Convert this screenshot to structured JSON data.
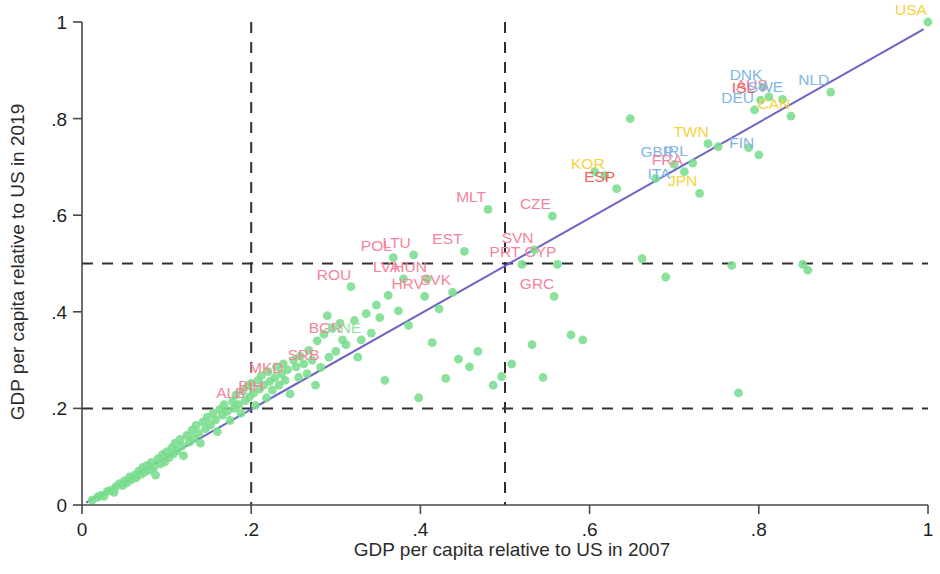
{
  "chart_data": {
    "type": "scatter",
    "title": "",
    "xlabel": "GDP per capita relative to US in 2007",
    "ylabel": "GDP per capita relative to US in 2019",
    "xlim": [
      0,
      1
    ],
    "ylim": [
      0,
      1
    ],
    "xticks": [
      "0",
      ".2",
      ".4",
      ".6",
      ".8",
      "1"
    ],
    "xtick_values": [
      0,
      0.2,
      0.4,
      0.6,
      0.8,
      1
    ],
    "yticks": [
      "0",
      ".2",
      ".4",
      ".6",
      ".8",
      "1"
    ],
    "ytick_values": [
      0,
      0.2,
      0.4,
      0.6,
      0.8,
      1
    ],
    "grid": false,
    "legend": "none",
    "colors": {
      "point": "#79dd8d",
      "fit_line": "#6b63c8",
      "reference_dash": "#303030",
      "label_pink": "#f4849b",
      "label_blue": "#7fb6e8",
      "label_yellow": "#f5d33c",
      "label_red": "#f0615f",
      "label_green": "#8fe3a0",
      "axis": "#4a4a4a"
    },
    "reference_lines": {
      "vertical": [
        0.2,
        0.5
      ],
      "horizontal": [
        0.2,
        0.5
      ],
      "style": "dashed"
    },
    "fit_line": {
      "type": "45-degree / regression",
      "x0": 0.005,
      "y0": 0.005,
      "x1": 0.995,
      "y1": 0.985
    },
    "labeled_points": [
      {
        "code": "USA",
        "x": 1.0,
        "y": 1.0,
        "color": "#f5d33c"
      },
      {
        "code": "NLD",
        "x": 0.885,
        "y": 0.855,
        "color": "#7fb6e8"
      },
      {
        "code": "DNK",
        "x": 0.805,
        "y": 0.865,
        "color": "#7fb6e8"
      },
      {
        "code": "AUS",
        "x": 0.812,
        "y": 0.845,
        "color": "#f4849b"
      },
      {
        "code": "ISL",
        "x": 0.802,
        "y": 0.838,
        "color": "#f0615f"
      },
      {
        "code": "SWE",
        "x": 0.828,
        "y": 0.84,
        "color": "#7fb6e8"
      },
      {
        "code": "DEU",
        "x": 0.795,
        "y": 0.818,
        "color": "#7fb6e8"
      },
      {
        "code": "CAN",
        "x": 0.838,
        "y": 0.805,
        "color": "#f5d33c"
      },
      {
        "code": "FIN",
        "x": 0.8,
        "y": 0.725,
        "color": "#7fb6e8"
      },
      {
        "code": "TWN",
        "x": 0.74,
        "y": 0.748,
        "color": "#f5d33c"
      },
      {
        "code": "GBR",
        "x": 0.7,
        "y": 0.705,
        "color": "#7fb6e8"
      },
      {
        "code": "IRL",
        "x": 0.722,
        "y": 0.708,
        "color": "#7fb6e8"
      },
      {
        "code": "FRA",
        "x": 0.712,
        "y": 0.69,
        "color": "#f4849b"
      },
      {
        "code": "ITA",
        "x": 0.702,
        "y": 0.66,
        "color": "#7fb6e8"
      },
      {
        "code": "JPN",
        "x": 0.73,
        "y": 0.645,
        "color": "#f5d33c"
      },
      {
        "code": "KOR",
        "x": 0.618,
        "y": 0.682,
        "color": "#f5d33c"
      },
      {
        "code": "ESP",
        "x": 0.632,
        "y": 0.655,
        "color": "#f0615f"
      },
      {
        "code": "CZE",
        "x": 0.556,
        "y": 0.598,
        "color": "#f4849b"
      },
      {
        "code": "MLT",
        "x": 0.48,
        "y": 0.612,
        "color": "#f4849b"
      },
      {
        "code": "EST",
        "x": 0.452,
        "y": 0.525,
        "color": "#f4849b"
      },
      {
        "code": "SVN",
        "x": 0.535,
        "y": 0.528,
        "color": "#f4849b"
      },
      {
        "code": "PRT",
        "x": 0.52,
        "y": 0.498,
        "color": "#f4849b"
      },
      {
        "code": "CYP",
        "x": 0.562,
        "y": 0.498,
        "color": "#f4849b"
      },
      {
        "code": "POL",
        "x": 0.368,
        "y": 0.512,
        "color": "#f4849b"
      },
      {
        "code": "LTU",
        "x": 0.392,
        "y": 0.518,
        "color": "#f4849b"
      },
      {
        "code": "LVA",
        "x": 0.38,
        "y": 0.468,
        "color": "#f4849b"
      },
      {
        "code": "HUN",
        "x": 0.408,
        "y": 0.468,
        "color": "#f4849b"
      },
      {
        "code": "SVK",
        "x": 0.438,
        "y": 0.44,
        "color": "#f4849b"
      },
      {
        "code": "HRV",
        "x": 0.405,
        "y": 0.432,
        "color": "#f4849b"
      },
      {
        "code": "ROU",
        "x": 0.318,
        "y": 0.452,
        "color": "#f4849b"
      },
      {
        "code": "GRC",
        "x": 0.558,
        "y": 0.432,
        "color": "#f4849b"
      },
      {
        "code": "BGR",
        "x": 0.308,
        "y": 0.342,
        "color": "#f4849b"
      },
      {
        "code": "MNE",
        "x": 0.33,
        "y": 0.342,
        "color": "#8fe3a0"
      },
      {
        "code": "SRB",
        "x": 0.282,
        "y": 0.285,
        "color": "#f4849b"
      },
      {
        "code": "MKD",
        "x": 0.238,
        "y": 0.258,
        "color": "#f4849b"
      },
      {
        "code": "BIH",
        "x": 0.22,
        "y": 0.222,
        "color": "#f4849b"
      },
      {
        "code": "ALB",
        "x": 0.196,
        "y": 0.208,
        "color": "#f4849b"
      }
    ],
    "points": [
      [
        0.012,
        0.01
      ],
      [
        0.018,
        0.016
      ],
      [
        0.022,
        0.02
      ],
      [
        0.026,
        0.018
      ],
      [
        0.03,
        0.028
      ],
      [
        0.034,
        0.03
      ],
      [
        0.038,
        0.026
      ],
      [
        0.04,
        0.038
      ],
      [
        0.044,
        0.044
      ],
      [
        0.048,
        0.04
      ],
      [
        0.05,
        0.05
      ],
      [
        0.053,
        0.046
      ],
      [
        0.056,
        0.058
      ],
      [
        0.058,
        0.052
      ],
      [
        0.062,
        0.062
      ],
      [
        0.064,
        0.056
      ],
      [
        0.067,
        0.07
      ],
      [
        0.07,
        0.064
      ],
      [
        0.072,
        0.078
      ],
      [
        0.074,
        0.068
      ],
      [
        0.077,
        0.082
      ],
      [
        0.08,
        0.072
      ],
      [
        0.082,
        0.088
      ],
      [
        0.085,
        0.078
      ],
      [
        0.087,
        0.062
      ],
      [
        0.09,
        0.096
      ],
      [
        0.093,
        0.085
      ],
      [
        0.095,
        0.104
      ],
      [
        0.098,
        0.09
      ],
      [
        0.1,
        0.11
      ],
      [
        0.103,
        0.098
      ],
      [
        0.106,
        0.118
      ],
      [
        0.108,
        0.106
      ],
      [
        0.11,
        0.128
      ],
      [
        0.112,
        0.112
      ],
      [
        0.116,
        0.136
      ],
      [
        0.118,
        0.122
      ],
      [
        0.12,
        0.102
      ],
      [
        0.124,
        0.144
      ],
      [
        0.127,
        0.13
      ],
      [
        0.13,
        0.155
      ],
      [
        0.132,
        0.138
      ],
      [
        0.135,
        0.165
      ],
      [
        0.138,
        0.148
      ],
      [
        0.14,
        0.128
      ],
      [
        0.143,
        0.172
      ],
      [
        0.146,
        0.158
      ],
      [
        0.148,
        0.182
      ],
      [
        0.152,
        0.166
      ],
      [
        0.155,
        0.19
      ],
      [
        0.158,
        0.176
      ],
      [
        0.16,
        0.152
      ],
      [
        0.163,
        0.198
      ],
      [
        0.166,
        0.186
      ],
      [
        0.168,
        0.208
      ],
      [
        0.172,
        0.194
      ],
      [
        0.175,
        0.175
      ],
      [
        0.178,
        0.214
      ],
      [
        0.18,
        0.2
      ],
      [
        0.182,
        0.228
      ],
      [
        0.185,
        0.208
      ],
      [
        0.188,
        0.19
      ],
      [
        0.19,
        0.236
      ],
      [
        0.193,
        0.216
      ],
      [
        0.196,
        0.246
      ],
      [
        0.198,
        0.224
      ],
      [
        0.2,
        0.252
      ],
      [
        0.203,
        0.232
      ],
      [
        0.205,
        0.206
      ],
      [
        0.208,
        0.258
      ],
      [
        0.21,
        0.24
      ],
      [
        0.212,
        0.268
      ],
      [
        0.215,
        0.248
      ],
      [
        0.218,
        0.222
      ],
      [
        0.22,
        0.276
      ],
      [
        0.222,
        0.256
      ],
      [
        0.225,
        0.238
      ],
      [
        0.228,
        0.264
      ],
      [
        0.23,
        0.286
      ],
      [
        0.233,
        0.248
      ],
      [
        0.236,
        0.272
      ],
      [
        0.238,
        0.292
      ],
      [
        0.24,
        0.258
      ],
      [
        0.243,
        0.28
      ],
      [
        0.246,
        0.23
      ],
      [
        0.25,
        0.3
      ],
      [
        0.253,
        0.286
      ],
      [
        0.256,
        0.264
      ],
      [
        0.258,
        0.308
      ],
      [
        0.262,
        0.292
      ],
      [
        0.266,
        0.272
      ],
      [
        0.268,
        0.32
      ],
      [
        0.272,
        0.3
      ],
      [
        0.276,
        0.248
      ],
      [
        0.278,
        0.34
      ],
      [
        0.282,
        0.285
      ],
      [
        0.286,
        0.354
      ],
      [
        0.29,
        0.392
      ],
      [
        0.292,
        0.306
      ],
      [
        0.296,
        0.366
      ],
      [
        0.3,
        0.318
      ],
      [
        0.305,
        0.376
      ],
      [
        0.308,
        0.342
      ],
      [
        0.312,
        0.332
      ],
      [
        0.318,
        0.452
      ],
      [
        0.322,
        0.382
      ],
      [
        0.326,
        0.306
      ],
      [
        0.33,
        0.342
      ],
      [
        0.336,
        0.396
      ],
      [
        0.342,
        0.356
      ],
      [
        0.348,
        0.414
      ],
      [
        0.352,
        0.388
      ],
      [
        0.358,
        0.258
      ],
      [
        0.362,
        0.434
      ],
      [
        0.368,
        0.512
      ],
      [
        0.374,
        0.402
      ],
      [
        0.38,
        0.468
      ],
      [
        0.386,
        0.372
      ],
      [
        0.392,
        0.518
      ],
      [
        0.398,
        0.222
      ],
      [
        0.405,
        0.432
      ],
      [
        0.408,
        0.468
      ],
      [
        0.414,
        0.336
      ],
      [
        0.422,
        0.406
      ],
      [
        0.43,
        0.262
      ],
      [
        0.438,
        0.44
      ],
      [
        0.445,
        0.302
      ],
      [
        0.452,
        0.525
      ],
      [
        0.458,
        0.286
      ],
      [
        0.468,
        0.318
      ],
      [
        0.48,
        0.612
      ],
      [
        0.486,
        0.248
      ],
      [
        0.496,
        0.266
      ],
      [
        0.508,
        0.292
      ],
      [
        0.52,
        0.498
      ],
      [
        0.532,
        0.332
      ],
      [
        0.535,
        0.528
      ],
      [
        0.545,
        0.264
      ],
      [
        0.556,
        0.598
      ],
      [
        0.558,
        0.432
      ],
      [
        0.562,
        0.498
      ],
      [
        0.578,
        0.352
      ],
      [
        0.592,
        0.342
      ],
      [
        0.606,
        0.69
      ],
      [
        0.618,
        0.682
      ],
      [
        0.632,
        0.655
      ],
      [
        0.648,
        0.8
      ],
      [
        0.662,
        0.51
      ],
      [
        0.678,
        0.676
      ],
      [
        0.69,
        0.472
      ],
      [
        0.7,
        0.705
      ],
      [
        0.712,
        0.69
      ],
      [
        0.722,
        0.708
      ],
      [
        0.73,
        0.645
      ],
      [
        0.74,
        0.748
      ],
      [
        0.752,
        0.742
      ],
      [
        0.768,
        0.496
      ],
      [
        0.776,
        0.232
      ],
      [
        0.788,
        0.74
      ],
      [
        0.795,
        0.818
      ],
      [
        0.8,
        0.725
      ],
      [
        0.802,
        0.838
      ],
      [
        0.805,
        0.865
      ],
      [
        0.812,
        0.845
      ],
      [
        0.828,
        0.84
      ],
      [
        0.838,
        0.805
      ],
      [
        0.852,
        0.498
      ],
      [
        0.858,
        0.486
      ],
      [
        0.885,
        0.855
      ],
      [
        1.0,
        1.0
      ]
    ]
  }
}
